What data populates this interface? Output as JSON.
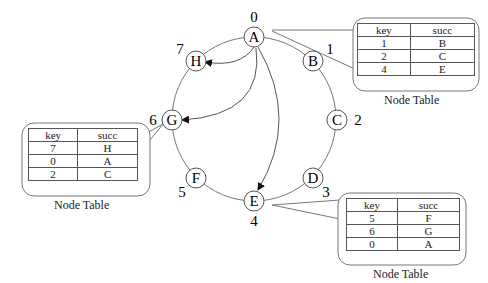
{
  "ring": {
    "nodes": [
      {
        "name": "A",
        "id": "0"
      },
      {
        "name": "B",
        "id": "1"
      },
      {
        "name": "C",
        "id": "2"
      },
      {
        "name": "D",
        "id": "3"
      },
      {
        "name": "E",
        "id": "4"
      },
      {
        "name": "F",
        "id": "5"
      },
      {
        "name": "G",
        "id": "6"
      },
      {
        "name": "H",
        "id": "7"
      }
    ]
  },
  "tables": {
    "A": {
      "caption": "Node Table",
      "headers": [
        "key",
        "succ"
      ],
      "rows": [
        [
          "1",
          "B"
        ],
        [
          "2",
          "C"
        ],
        [
          "4",
          "E"
        ]
      ]
    },
    "G": {
      "caption": "Node Table",
      "headers": [
        "key",
        "succ"
      ],
      "rows": [
        [
          "7",
          "H"
        ],
        [
          "0",
          "A"
        ],
        [
          "2",
          "C"
        ]
      ]
    },
    "E": {
      "caption": "Node Table",
      "headers": [
        "key",
        "succ"
      ],
      "rows": [
        [
          "5",
          "F"
        ],
        [
          "6",
          "G"
        ],
        [
          "0",
          "A"
        ]
      ]
    }
  }
}
